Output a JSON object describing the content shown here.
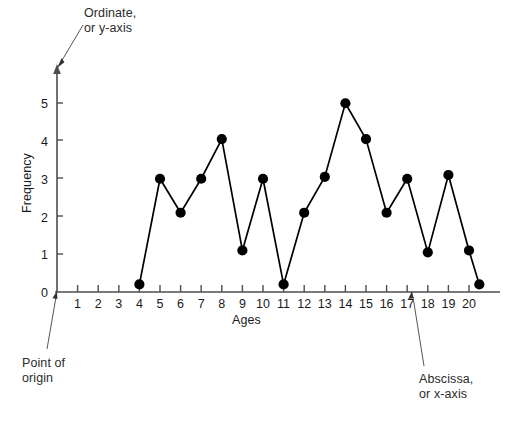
{
  "chart_data": {
    "type": "line",
    "title": "",
    "xlabel": "Ages",
    "ylabel": "Frequency",
    "xlim": [
      0.2,
      21.2
    ],
    "ylim": [
      0,
      5.6
    ],
    "grid": false,
    "legend": "none",
    "xticks": [
      1,
      2,
      3,
      4,
      5,
      6,
      7,
      8,
      9,
      10,
      11,
      12,
      13,
      14,
      15,
      16,
      17,
      18,
      19,
      20
    ],
    "xticklabels": [
      "1",
      "2",
      "3",
      "4",
      "5",
      "6",
      "7",
      "8",
      "9",
      "10",
      "11",
      "12",
      "13",
      "14",
      "15",
      "16",
      "17",
      "18",
      "19",
      "20"
    ],
    "yticks": [
      0,
      1,
      2,
      3,
      4,
      5
    ],
    "yticklabels": [
      "0",
      "1",
      "2",
      "3",
      "4",
      "5"
    ],
    "x": [
      4,
      5,
      6,
      7,
      8,
      9,
      10,
      11,
      12,
      13,
      14,
      15,
      16,
      17,
      18,
      19,
      20,
      20.5
    ],
    "values": [
      0.2,
      3,
      2.1,
      3,
      4.05,
      1.1,
      3,
      0.2,
      2.1,
      3.05,
      5,
      4.05,
      2.1,
      3,
      1.05,
      3.1,
      1.1,
      0.2
    ],
    "marker": "filled-circle",
    "marker_color": "#000000",
    "line_color": "#000000"
  },
  "annotations": {
    "ordinate": {
      "line1": "Ordinate,",
      "line2": "or y-axis"
    },
    "origin": {
      "line1": "Point of",
      "line2": "origin"
    },
    "abscissa": {
      "line1": "Abscissa,",
      "line2": "or x-axis"
    }
  },
  "colors": {
    "axis": "#4d4d4d",
    "data": "#000000",
    "text": "#1a1a1a",
    "leader": "#555555",
    "background": "#ffffff"
  }
}
